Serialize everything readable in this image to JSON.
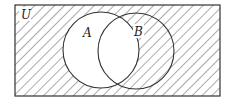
{
  "diagram": {
    "type": "venn",
    "universe_label": "U",
    "sets": [
      {
        "label": "A",
        "cx": 101,
        "cy": 50,
        "r": 38,
        "shaded": false
      },
      {
        "label": "B",
        "cx": 136,
        "cy": 51,
        "r": 38,
        "shaded": true
      }
    ],
    "shaded_region": "complement of A",
    "stroke_color": "#333333",
    "hatch_color": "#555555",
    "background_color": "#ffffff"
  }
}
